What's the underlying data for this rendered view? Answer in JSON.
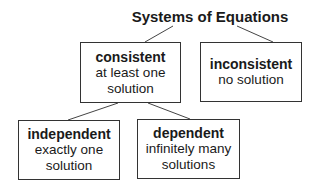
{
  "title": "Systems of Equations",
  "nodes": {
    "consistent": {
      "heading": "consistent",
      "line1": "at least one",
      "line2": "solution"
    },
    "inconsistent": {
      "heading": "inconsistent",
      "line1": "no solution"
    },
    "independent": {
      "heading": "independent",
      "line1": "exactly one",
      "line2": "solution"
    },
    "dependent": {
      "heading": "dependent",
      "line1": "infinitely many",
      "line2": "solutions"
    }
  },
  "edges": [
    {
      "from": "Systems of Equations",
      "to": "consistent"
    },
    {
      "from": "Systems of Equations",
      "to": "inconsistent"
    },
    {
      "from": "consistent",
      "to": "independent"
    },
    {
      "from": "consistent",
      "to": "dependent"
    }
  ]
}
